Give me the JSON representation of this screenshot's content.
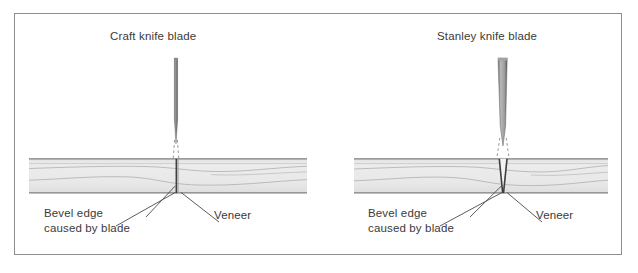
{
  "figure": {
    "kind": "technical-illustration",
    "frame_border_color": "#8d8d8d",
    "background_color": "#ffffff"
  },
  "panels": [
    {
      "id": "left",
      "title": "Craft knife blade",
      "blade": {
        "name": "craft-knife-blade",
        "shape": "narrow-parallel-taper",
        "top_width_px": 3,
        "color_light": "#9a9a9a",
        "color_dark": "#4a4a4a"
      },
      "cut": {
        "style": "straight-vertical-kerf",
        "kerf_width_px": 1.5
      },
      "labels": {
        "bevel_line1": "Bevel edge",
        "bevel_line2": "caused by blade",
        "veneer": "Veneer"
      }
    },
    {
      "id": "right",
      "title": "Stanley knife blade",
      "blade": {
        "name": "stanley-knife-blade",
        "shape": "wide-wedge-taper",
        "top_width_px": 9,
        "color_light": "#b4b4b4",
        "color_dark": "#5a5a5a"
      },
      "cut": {
        "style": "v-shaped-bevelled-kerf",
        "kerf_width_px": 7
      },
      "labels": {
        "bevel_line1": "Bevel edge",
        "bevel_line2": "caused by blade",
        "veneer": "Veneer"
      }
    }
  ],
  "board": {
    "name": "veneered-board",
    "fill_color": "#e9e9e9",
    "edge_color": "#888888",
    "grain_color": "#b0b0b0",
    "top_y": 157,
    "bottom_y": 192
  },
  "guide_lines": {
    "name": "dashed-cut-guides",
    "style": "dashed",
    "color": "#888888"
  },
  "footer": {
    "partial_text": ""
  }
}
